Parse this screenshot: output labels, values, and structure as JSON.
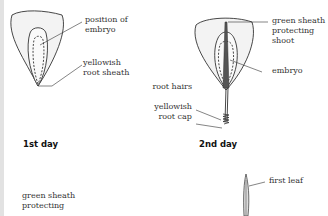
{
  "figure": {
    "panels": [
      {
        "caption": "1st day",
        "labels": {
          "position_of_embryo": [
            "position of",
            "embryo"
          ],
          "yellowish_root_sheath": [
            "yellowish",
            "root sheath"
          ]
        }
      },
      {
        "caption": "2nd day",
        "labels": {
          "green_sheath_protecting_shoot": [
            "green sheath",
            "protecting",
            "shoot"
          ],
          "embryo": [
            "embryo"
          ],
          "root_hairs": [
            "root hairs"
          ],
          "yellowish_root_cap": [
            "yellowish",
            "root cap"
          ]
        }
      },
      {
        "caption": "",
        "labels": {
          "green_sheath_protecting": [
            "green sheath",
            "protecting"
          ]
        }
      },
      {
        "caption": "",
        "labels": {
          "first_leaf": [
            "first leaf"
          ]
        }
      }
    ]
  },
  "colors": {
    "seed_fill": "#f3f3f3",
    "outline": "#333333",
    "shoot_dark": "#555555",
    "left_strip": "#e2e2e2"
  }
}
